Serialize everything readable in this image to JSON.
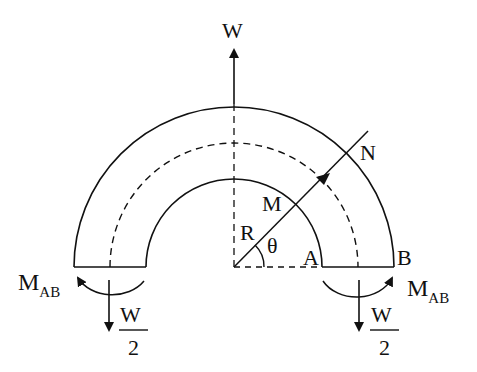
{
  "diagram": {
    "labels": {
      "load_top": "W",
      "point_N": "N",
      "point_M": "M",
      "radius": "R",
      "angle": "θ",
      "point_A": "A",
      "point_B": "B",
      "moment_left_main": "M",
      "moment_left_sub": "AB",
      "moment_right_main": "M",
      "moment_right_sub": "AB",
      "reaction_left_num": "W",
      "reaction_left_den": "2",
      "reaction_right_num": "W",
      "reaction_right_den": "2"
    },
    "geometry": {
      "center": [
        234,
        267
      ],
      "outer_radius": 160,
      "mean_radius": 124,
      "inner_radius": 88
    },
    "colors": {
      "stroke": "#111111",
      "background": "#ffffff"
    }
  }
}
